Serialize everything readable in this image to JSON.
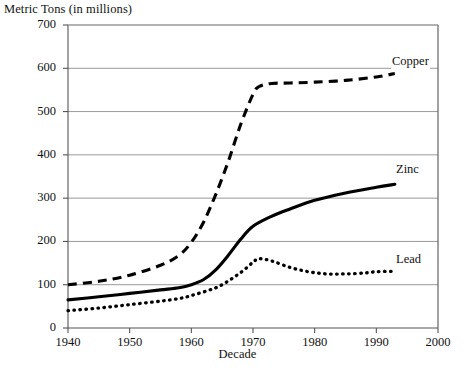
{
  "chart_data": {
    "type": "line",
    "title": "",
    "ylabel": "Metric Tons (in millions)",
    "xlabel": "Decade",
    "xlim": [
      1940,
      2000
    ],
    "ylim": [
      0,
      700
    ],
    "xticks": [
      1940,
      1950,
      1960,
      1970,
      1980,
      1990,
      2000
    ],
    "yticks": [
      0,
      100,
      200,
      300,
      400,
      500,
      600,
      700
    ],
    "grid": "horizontal",
    "legend_position": "inline-right-of-series",
    "line_color": "#000000",
    "grid_color": "#999999",
    "axis_color": "#555555",
    "series": [
      {
        "name": "Copper",
        "style": "dashed",
        "label_text": "Copper",
        "x": [
          1940,
          1945,
          1950,
          1955,
          1958,
          1960,
          1962,
          1964,
          1966,
          1968,
          1970,
          1971,
          1973,
          1976,
          1980,
          1985,
          1990,
          1993
        ],
        "values": [
          100,
          108,
          122,
          145,
          168,
          198,
          245,
          310,
          385,
          470,
          540,
          558,
          565,
          566,
          568,
          572,
          580,
          588
        ]
      },
      {
        "name": "Zinc",
        "style": "solid",
        "label_text": "Zinc",
        "x": [
          1940,
          1945,
          1950,
          1955,
          1958,
          1960,
          1962,
          1964,
          1966,
          1968,
          1970,
          1973,
          1976,
          1980,
          1985,
          1990,
          1993
        ],
        "values": [
          65,
          72,
          80,
          88,
          93,
          100,
          112,
          135,
          168,
          205,
          235,
          258,
          275,
          295,
          312,
          325,
          332
        ]
      },
      {
        "name": "Lead",
        "style": "dotted",
        "label_text": "Lead",
        "x": [
          1940,
          1945,
          1950,
          1955,
          1958,
          1960,
          1963,
          1965,
          1968,
          1970,
          1971,
          1973,
          1976,
          1979,
          1982,
          1985,
          1988,
          1990,
          1993
        ],
        "values": [
          40,
          46,
          54,
          62,
          68,
          75,
          88,
          100,
          128,
          152,
          160,
          155,
          140,
          130,
          125,
          125,
          127,
          130,
          131
        ]
      }
    ]
  },
  "axes": {
    "y_tick_labels": [
      "700",
      "600",
      "500",
      "400",
      "300",
      "200",
      "100",
      "0"
    ],
    "x_tick_labels": [
      "1940",
      "1950",
      "1960",
      "1970",
      "1980",
      "1990",
      "2000"
    ],
    "y_axis_title": "Metric Tons (in millions)",
    "x_axis_title": "Decade"
  },
  "labels": {
    "copper": "Copper",
    "zinc": "Zinc",
    "lead": "Lead"
  }
}
